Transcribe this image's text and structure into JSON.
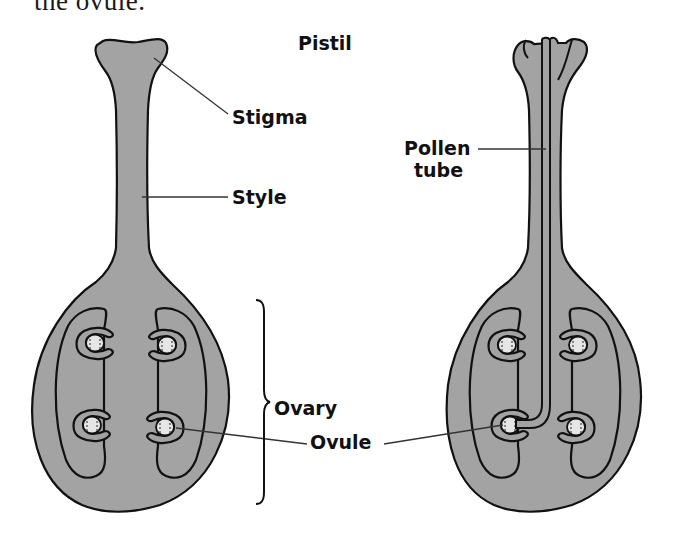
{
  "caption": {
    "text": "the ovule."
  },
  "title": "Pistil",
  "labels": {
    "stigma": "Stigma",
    "style": "Style",
    "ovary": "Ovary",
    "ovule": "Ovule",
    "pollen_tube_line1": "Pollen",
    "pollen_tube_line2": "tube"
  },
  "figures": [
    {
      "id": "pistil-left",
      "description": "Pistil before pollination",
      "parts": [
        "stigma",
        "style",
        "ovary",
        "ovule x4"
      ]
    },
    {
      "id": "pistil-right",
      "description": "Pistil with pollen tube growing down the style to an ovule",
      "parts": [
        "stigma",
        "style",
        "ovary",
        "ovule x4",
        "pollen tube"
      ]
    }
  ],
  "colors": {
    "tissue_fill": "#a3a3a3",
    "ovule_fill": "#e6e6e6",
    "outline": "#111111",
    "leader_line": "#333333",
    "background": "#ffffff"
  }
}
